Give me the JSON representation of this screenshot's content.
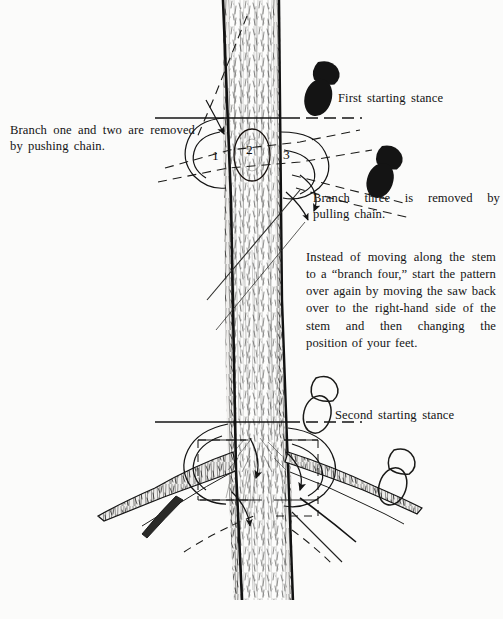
{
  "figure": {
    "background_color": "#fbfbfa",
    "ink_color": "#141414"
  },
  "captions": {
    "left_note": "Branch one and two are removed by pushing chain.",
    "first_stance": "First starting stance",
    "branch_three": "Branch three is removed by pulling chain.",
    "instead_paragraph": "Instead of moving along the stem to a “branch four,” start the pattern over again by moving the saw back over to the right-hand side of the stem and then changing the position of your feet.",
    "second_stance": "Second starting stance"
  },
  "branch_labels": [
    {
      "id": "branch-one",
      "text": "1"
    },
    {
      "id": "branch-two",
      "text": "2"
    },
    {
      "id": "branch-three",
      "text": "3"
    }
  ],
  "footprints": [
    {
      "id": "first-stance-toe",
      "style": "filled"
    },
    {
      "id": "first-stance-heel",
      "style": "filled"
    },
    {
      "id": "first-stance-second-foot",
      "style": "filled"
    },
    {
      "id": "second-stance-toe",
      "style": "outline"
    },
    {
      "id": "second-stance-heel",
      "style": "outline"
    },
    {
      "id": "second-stance-second-foot",
      "style": "outline"
    }
  ],
  "guides": {
    "first_stance_rule": "solid-and-dashed horizontal reference line",
    "second_stance_rule": "solid-and-dashed horizontal reference line",
    "cut_paths": "dashed chain path lines with arrowheads"
  }
}
